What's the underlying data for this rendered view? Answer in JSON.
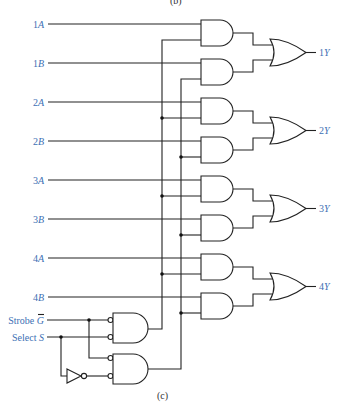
{
  "figure": {
    "top_caption_partial": "(b)",
    "caption": "(c)",
    "label_color": "#3d6fb4",
    "wire_color": "#222222"
  },
  "inputs": [
    {
      "num": "1",
      "letter": "A"
    },
    {
      "num": "1",
      "letter": "B"
    },
    {
      "num": "2",
      "letter": "A"
    },
    {
      "num": "2",
      "letter": "B"
    },
    {
      "num": "3",
      "letter": "A"
    },
    {
      "num": "3",
      "letter": "B"
    },
    {
      "num": "4",
      "letter": "A"
    },
    {
      "num": "4",
      "letter": "B"
    }
  ],
  "outputs": [
    {
      "num": "1",
      "letter": "Y"
    },
    {
      "num": "2",
      "letter": "Y"
    },
    {
      "num": "3",
      "letter": "Y"
    },
    {
      "num": "4",
      "letter": "Y"
    }
  ],
  "controls": {
    "strobe": {
      "word": "Strobe",
      "symbol": "G",
      "overbar": true
    },
    "select": {
      "word": "Select",
      "symbol": "S",
      "overbar": false
    }
  },
  "gates": {
    "and_count": 8,
    "or_count": 4,
    "control_nand_count": 2,
    "inverter_count": 1
  }
}
